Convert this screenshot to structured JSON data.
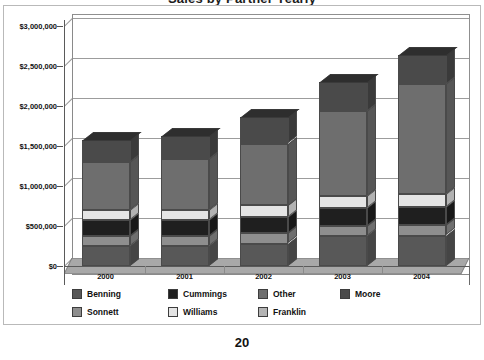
{
  "page": {
    "number": "20"
  },
  "chart_data": {
    "type": "bar",
    "subtype": "stacked-column-3d",
    "title": "Sales by Partner Yearly",
    "xlabel": "",
    "ylabel": "",
    "ylim": [
      0,
      3000000
    ],
    "grid": true,
    "legend_position": "bottom",
    "categories": [
      "2000",
      "2001",
      "2002",
      "2003",
      "2004"
    ],
    "ytick_labels": [
      "$0",
      "$500,000",
      "$1,000,000",
      "$1,500,000",
      "$2,000,000",
      "$2,500,000",
      "$3,000,000"
    ],
    "ytick_values": [
      0,
      500000,
      1000000,
      1500000,
      2000000,
      2500000,
      3000000
    ],
    "series": [
      {
        "name": "Benning",
        "color": "#585858",
        "values": [
          250000,
          250000,
          280000,
          370000,
          380000
        ]
      },
      {
        "name": "Sonnett",
        "color": "#8e8e8e",
        "values": [
          130000,
          130000,
          130000,
          130000,
          130000
        ]
      },
      {
        "name": "Cummings",
        "color": "#1f1f1f",
        "values": [
          200000,
          200000,
          200000,
          230000,
          230000
        ]
      },
      {
        "name": "Williams",
        "color": "#e4e4e4",
        "values": [
          120000,
          120000,
          150000,
          150000,
          160000
        ]
      },
      {
        "name": "Franklin",
        "color": "#b4b4b4",
        "values": [
          0,
          0,
          0,
          0,
          0
        ]
      },
      {
        "name": "Other",
        "color": "#6e6e6e",
        "values": [
          600000,
          640000,
          770000,
          1060000,
          1380000
        ]
      },
      {
        "name": "Moore",
        "color": "#4a4a4a",
        "values": [
          280000,
          290000,
          330000,
          360000,
          360000
        ]
      }
    ],
    "totals": [
      1580000,
      1630000,
      1860000,
      2300000,
      2640000
    ],
    "stack_order_bottom_to_top": [
      "Benning",
      "Sonnett",
      "Cummings",
      "Williams",
      "Other",
      "Moore"
    ]
  },
  "legend": {
    "items": [
      {
        "label": "Benning",
        "color": "#585858"
      },
      {
        "label": "Cummings",
        "color": "#1f1f1f"
      },
      {
        "label": "Other",
        "color": "#6e6e6e"
      },
      {
        "label": "Moore",
        "color": "#4a4a4a"
      },
      {
        "label": "Sonnett",
        "color": "#8e8e8e"
      },
      {
        "label": "Williams",
        "color": "#e4e4e4"
      },
      {
        "label": "Franklin",
        "color": "#b4b4b4"
      }
    ]
  }
}
